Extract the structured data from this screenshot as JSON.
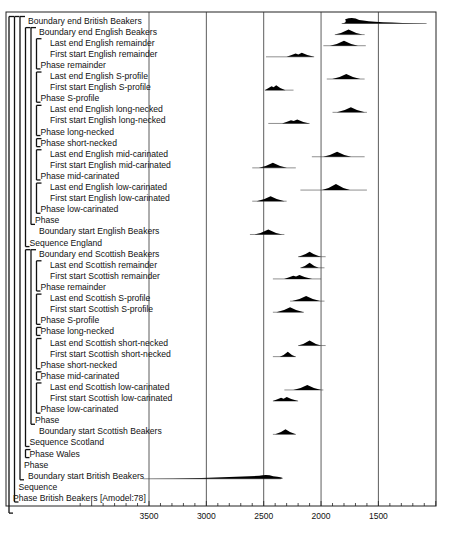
{
  "chart_data": {
    "type": "density-ridge",
    "title": "",
    "xlabel": "",
    "ylabel": "",
    "x_axis": {
      "direction": "reversed",
      "units": "cal BC",
      "ticks": [
        3500,
        3000,
        2500,
        2000,
        1500
      ],
      "range": [
        4100,
        1000
      ],
      "grid": true
    },
    "model_label": "Phase British Beakers [Amodel:78]",
    "rows": [
      {
        "label": "Boundary end British Beakers",
        "indent": 1,
        "dist": {
          "from": 1820,
          "peak": 1720,
          "to": 1080,
          "h": 7,
          "long_tail": true
        }
      },
      {
        "label": "Boundary end English Beakers",
        "indent": 2,
        "dist": {
          "from": 1880,
          "peak": 1760,
          "to": 1620,
          "h": 5
        }
      },
      {
        "label": "Last end English remainder",
        "indent": 3,
        "dist": {
          "from": 1980,
          "peak": 1800,
          "to": 1610,
          "h": 5
        }
      },
      {
        "label": "First start English remainder",
        "indent": 3,
        "dist": {
          "from": 2480,
          "peak": 2180,
          "to": 2060,
          "h": 4,
          "bimodal": true
        }
      },
      {
        "label": "Phase remainder",
        "indent": 2.5,
        "bracket_end": true
      },
      {
        "label": "Last end English S-profile",
        "indent": 3,
        "dist": {
          "from": 1950,
          "peak": 1780,
          "to": 1620,
          "h": 5
        }
      },
      {
        "label": "First start English S-profile",
        "indent": 3,
        "dist": {
          "from": 2490,
          "peak": 2400,
          "to": 2240,
          "h": 5,
          "bimodal": true
        }
      },
      {
        "label": "Phase S-profile",
        "indent": 2.5,
        "bracket_end": true
      },
      {
        "label": "Last end English long-necked",
        "indent": 3,
        "dist": {
          "from": 1900,
          "peak": 1740,
          "to": 1600,
          "h": 5
        }
      },
      {
        "label": "First start English long-necked",
        "indent": 3,
        "dist": {
          "from": 2460,
          "peak": 2220,
          "to": 2100,
          "h": 4,
          "bimodal": true
        }
      },
      {
        "label": "Phase long-necked",
        "indent": 2.5,
        "bracket_end": true
      },
      {
        "label": "Phase short-necked",
        "indent": 2.5,
        "bracket_end": true
      },
      {
        "label": "Last end English mid-carinated",
        "indent": 3,
        "dist": {
          "from": 2080,
          "peak": 1860,
          "to": 1620,
          "h": 5
        }
      },
      {
        "label": "First start English mid-carinated",
        "indent": 3,
        "dist": {
          "from": 2600,
          "peak": 2420,
          "to": 2220,
          "h": 5
        }
      },
      {
        "label": "Phase mid-carinated",
        "indent": 2.5,
        "bracket_end": true
      },
      {
        "label": "Last end English low-carinated",
        "indent": 3,
        "dist": {
          "from": 2180,
          "peak": 1870,
          "to": 1600,
          "h": 6
        }
      },
      {
        "label": "First start English low-carinated",
        "indent": 3,
        "dist": {
          "from": 2600,
          "peak": 2440,
          "to": 2300,
          "h": 5
        }
      },
      {
        "label": "Phase low-carinated",
        "indent": 2.5,
        "bracket_end": true
      },
      {
        "label": "Phase",
        "indent": 2,
        "bracket_end": true
      },
      {
        "label": "Boundary start English Beakers",
        "indent": 2,
        "dist": {
          "from": 2620,
          "peak": 2460,
          "to": 2320,
          "h": 5
        }
      },
      {
        "label": "Sequence England",
        "indent": 1.5,
        "bracket_end": true
      },
      {
        "label": "Boundary end Scottish Beakers",
        "indent": 2,
        "dist": {
          "from": 2200,
          "peak": 2100,
          "to": 1960,
          "h": 5
        }
      },
      {
        "label": "Last end Scottish remainder",
        "indent": 3,
        "dist": {
          "from": 2180,
          "peak": 2100,
          "to": 1970,
          "h": 5
        }
      },
      {
        "label": "First start Scottish remainder",
        "indent": 3,
        "dist": {
          "from": 2420,
          "peak": 2200,
          "to": 2000,
          "h": 4,
          "bimodal": true
        }
      },
      {
        "label": "Phase remainder",
        "indent": 2.5,
        "bracket_end": true
      },
      {
        "label": "Last end Scottish S-profile",
        "indent": 3,
        "dist": {
          "from": 2270,
          "peak": 2130,
          "to": 1970,
          "h": 5
        }
      },
      {
        "label": "First start Scottish S-profile",
        "indent": 3,
        "dist": {
          "from": 2420,
          "peak": 2270,
          "to": 2150,
          "h": 5
        }
      },
      {
        "label": "Phase S-profile",
        "indent": 2.5,
        "bracket_end": true
      },
      {
        "label": "Phase long-necked",
        "indent": 2.5,
        "bracket_end": true
      },
      {
        "label": "Last end Scottish short-necked",
        "indent": 3,
        "dist": {
          "from": 2200,
          "peak": 2100,
          "to": 1960,
          "h": 5
        }
      },
      {
        "label": "First start Scottish short-necked",
        "indent": 3,
        "dist": {
          "from": 2420,
          "peak": 2290,
          "to": 2220,
          "h": 5
        }
      },
      {
        "label": "Phase short-necked",
        "indent": 2.5,
        "bracket_end": true
      },
      {
        "label": "Phase mid-carinated",
        "indent": 2.5,
        "bracket_end": true
      },
      {
        "label": "Last end Scottish low-carinated",
        "indent": 3,
        "dist": {
          "from": 2320,
          "peak": 2120,
          "to": 1980,
          "h": 5
        }
      },
      {
        "label": "First start Scottish low-carinated",
        "indent": 3,
        "dist": {
          "from": 2420,
          "peak": 2310,
          "to": 2200,
          "h": 4,
          "bimodal": true
        }
      },
      {
        "label": "Phase low-carinated",
        "indent": 2.5,
        "bracket_end": true
      },
      {
        "label": "Phase",
        "indent": 2,
        "bracket_end": true
      },
      {
        "label": "Boundary start Scottish Beakers",
        "indent": 2,
        "dist": {
          "from": 2420,
          "peak": 2310,
          "to": 2220,
          "h": 5
        }
      },
      {
        "label": "Sequence Scotland",
        "indent": 1.5,
        "bracket_end": true
      },
      {
        "label": "Phase Wales",
        "indent": 1.5,
        "bracket_end": true
      },
      {
        "label": "Phase",
        "indent": 1,
        "bracket_end": true
      },
      {
        "label": "Boundary start British Beakers",
        "indent": 1,
        "dist": {
          "from": 3550,
          "peak": 2470,
          "to": 2350,
          "h": 5,
          "long_tail": true
        }
      },
      {
        "label": "Sequence",
        "indent": 0.5,
        "bracket_end": true
      },
      {
        "label": "Phase British Beakers [Amodel:78]",
        "indent": 0,
        "bracket_end": true
      }
    ]
  }
}
